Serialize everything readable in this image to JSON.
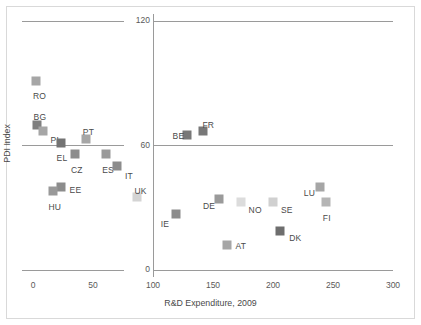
{
  "chart_data": {
    "type": "scatter",
    "title": "",
    "xlabel": "R&D Expenditure, 2009",
    "ylabel": "PDI Index",
    "xlim": [
      0,
      300
    ],
    "ylim": [
      0,
      120
    ],
    "xticks": [
      "0",
      "50",
      "100",
      "150",
      "200",
      "250",
      "300"
    ],
    "yticks": [
      "0",
      "60",
      "120"
    ],
    "grid": false,
    "legend": "none",
    "reference_lines": {
      "vertical_x": 100,
      "horizontal_y": 60
    },
    "points": [
      {
        "label": "RO",
        "x": 2.5,
        "y": 91,
        "color": "#a6a6a6",
        "label_dx": -3,
        "label_dy": 11
      },
      {
        "label": "BG",
        "x": 3,
        "y": 70,
        "color": "#7f7f7f",
        "label_dx": -3,
        "label_dy": -12
      },
      {
        "label": "PL",
        "x": 8,
        "y": 67,
        "color": "#a6a6a6",
        "label_dx": 8,
        "label_dy": 5
      },
      {
        "label": "EL",
        "x": 23,
        "y": 61,
        "color": "#737373",
        "label_dx": -4,
        "label_dy": 11
      },
      {
        "label": "CZ",
        "x": 35,
        "y": 56,
        "color": "#8c8c8c",
        "label_dx": -4,
        "label_dy": 12
      },
      {
        "label": "PT",
        "x": 44,
        "y": 63,
        "color": "#a6a6a6",
        "label_dx": -3,
        "label_dy": -11
      },
      {
        "label": "ES",
        "x": 61,
        "y": 56,
        "color": "#9a9a9a",
        "label_dx": -4,
        "label_dy": 12
      },
      {
        "label": "IT",
        "x": 70,
        "y": 50,
        "color": "#8c8c8c",
        "label_dx": 8,
        "label_dy": 6
      },
      {
        "label": "EE",
        "x": 23,
        "y": 40,
        "color": "#8c8c8c",
        "label_dx": 9,
        "label_dy": -1
      },
      {
        "label": "HU",
        "x": 17,
        "y": 38,
        "color": "#999999",
        "label_dx": -5,
        "label_dy": 12
      },
      {
        "label": "UK",
        "x": 87,
        "y": 35,
        "color": "#d4d4d4",
        "label_dx": -3,
        "label_dy": -10
      },
      {
        "label": "BE",
        "x": 128,
        "y": 65,
        "color": "#787878",
        "label_dx": -14,
        "label_dy": -3
      },
      {
        "label": "FR",
        "x": 142,
        "y": 67,
        "color": "#787878",
        "label_dx": -1,
        "label_dy": -10
      },
      {
        "label": "DE",
        "x": 155,
        "y": 34,
        "color": "#9a9a9a",
        "label_dx": -16,
        "label_dy": 3
      },
      {
        "label": "NO",
        "x": 173,
        "y": 33,
        "color": "#dcdcdc",
        "label_dx": 8,
        "label_dy": 4
      },
      {
        "label": "SE",
        "x": 200,
        "y": 33,
        "color": "#d0d0d0",
        "label_dx": 8,
        "label_dy": 4
      },
      {
        "label": "IE",
        "x": 119,
        "y": 27,
        "color": "#8c8c8c",
        "label_dx": -15,
        "label_dy": 6
      },
      {
        "label": "DK",
        "x": 206,
        "y": 19,
        "color": "#6e6e6e",
        "label_dx": 9,
        "label_dy": 3
      },
      {
        "label": "AT",
        "x": 162,
        "y": 12,
        "color": "#a6a6a6",
        "label_dx": 8,
        "label_dy": -3
      },
      {
        "label": "LU",
        "x": 239,
        "y": 40,
        "color": "#a6a6a6",
        "label_dx": -16,
        "label_dy": 2
      },
      {
        "label": "FI",
        "x": 244,
        "y": 33,
        "color": "#b5b5b5",
        "label_dx": -3,
        "label_dy": 12
      }
    ]
  }
}
